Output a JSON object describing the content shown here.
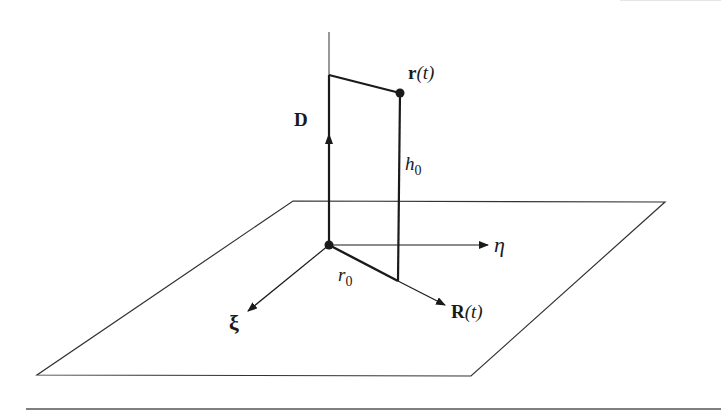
{
  "figure": {
    "labels": {
      "position_vector": {
        "main": "r",
        "arg": "(t)"
      },
      "dipole": "D",
      "height": {
        "main": "h",
        "sub": "0"
      },
      "eta_axis": "η",
      "radius": {
        "main": "r",
        "sub": "0"
      },
      "xi_axis": "ξ",
      "projection": {
        "main": "R",
        "arg": "(t)"
      }
    },
    "colors": {
      "stroke": "#1a1a1a",
      "plane": "#333333",
      "background": "#ffffff"
    }
  }
}
